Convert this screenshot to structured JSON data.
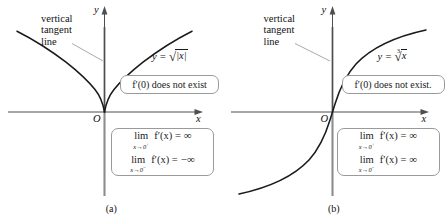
{
  "figure": {
    "panels": [
      {
        "id": "panel-a",
        "caption": "(a)",
        "tangent_label_lines": [
          "vertical",
          "tangent",
          "line"
        ],
        "y_axis_label": "y",
        "x_axis_label": "x",
        "origin_label": "O",
        "function_label": {
          "lhs": "y =",
          "radical_index": "",
          "radicand": "|x|",
          "full": "y = √|x|"
        },
        "dne_note": "f′(0) does not exist",
        "limits": [
          {
            "op": "lim",
            "sub_var": "x",
            "sub_arrow": "→",
            "sub_target": "0",
            "sub_sign": "+",
            "body": "f′(x) =",
            "value": "∞"
          },
          {
            "op": "lim",
            "sub_var": "x",
            "sub_arrow": "→",
            "sub_target": "0",
            "sub_sign": "−",
            "body": "f′(x) =",
            "value": "−∞"
          }
        ],
        "curve_type": "sqrt-abs-cusp"
      },
      {
        "id": "panel-b",
        "caption": "(b)",
        "tangent_label_lines": [
          "vertical",
          "tangent",
          "line"
        ],
        "y_axis_label": "y",
        "x_axis_label": "x",
        "origin_label": "O",
        "function_label": {
          "lhs": "y =",
          "radical_index": "3",
          "radicand": "x",
          "full": "y = ∛ x"
        },
        "dne_note": "f′(0) does not exist.",
        "limits": [
          {
            "op": "lim",
            "sub_var": "x",
            "sub_arrow": "→",
            "sub_target": "0",
            "sub_sign": "+",
            "body": "f′(x) =",
            "value": "∞"
          },
          {
            "op": "lim",
            "sub_var": "x",
            "sub_arrow": "→",
            "sub_target": "0",
            "sub_sign": "−",
            "body": "f′(x) =",
            "value": "∞"
          }
        ],
        "curve_type": "cube-root-s"
      }
    ],
    "colors": {
      "curve": "#1a1a1a",
      "axis": "#555555",
      "tangent_segment": "#7a7a7a",
      "leader": "#8a8a8a",
      "callout_border": "#9a9a9a",
      "background": "#ffffff"
    }
  }
}
